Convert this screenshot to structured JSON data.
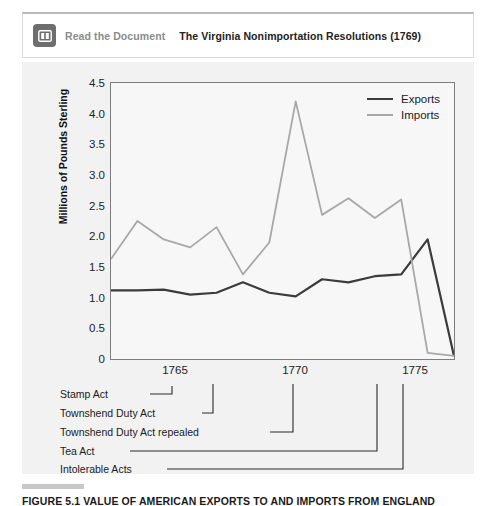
{
  "doc_bar": {
    "icon": "open-book-icon",
    "link_label": "Read the Document",
    "title": "The Virginia Nonimportation Resolutions (1769)"
  },
  "caption": {
    "number": "FIGURE 5.1",
    "text": "VALUE OF AMERICAN EXPORTS TO AND IMPORTS FROM ENGLAND",
    "full": "FIGURE 5.1  VALUE OF AMERICAN EXPORTS TO AND IMPORTS FROM ENGLAND"
  },
  "colors": {
    "exports": "#3b3b3b",
    "imports": "#a8a8a8",
    "panel": "#f2f2f2",
    "plot_bg": "#f7f7f7",
    "frame": "#7d7d7d",
    "icon_bg": "#6e6e6e",
    "muted_text": "#8b8b8b"
  },
  "chart_data": {
    "type": "line",
    "title": "VALUE OF AMERICAN EXPORTS TO AND IMPORTS FROM ENGLAND",
    "xlabel": "",
    "ylabel": "Millions of Pounds Sterling",
    "ylabel_lines": [
      "Millions of",
      "Pounds Sterling"
    ],
    "xlim": [
      1763,
      1776
    ],
    "ylim": [
      0,
      4.5
    ],
    "grid": false,
    "legend_position": "top-right",
    "yticks": [
      "0",
      "0.5",
      "1.0",
      "1.5",
      "2.0",
      "2.5",
      "3.0",
      "3.5",
      "4.0",
      "4.5"
    ],
    "ytick_values": [
      0,
      0.5,
      1.0,
      1.5,
      2.0,
      2.5,
      3.0,
      3.5,
      4.0,
      4.5
    ],
    "xticks": [
      "1765",
      "1770",
      "1775"
    ],
    "xtick_values": [
      1765,
      1770,
      1775
    ],
    "x": [
      1763,
      1764,
      1765,
      1766,
      1767,
      1768,
      1769,
      1770,
      1771,
      1772,
      1773,
      1774,
      1775,
      1776
    ],
    "series": [
      {
        "name": "Exports",
        "color": "#3b3b3b",
        "values": [
          1.12,
          1.12,
          1.13,
          1.05,
          1.08,
          1.25,
          1.08,
          1.02,
          1.3,
          1.25,
          1.35,
          1.38,
          1.95,
          0.05
        ]
      },
      {
        "name": "Imports",
        "color": "#a8a8a8",
        "values": [
          1.63,
          2.25,
          1.95,
          1.82,
          2.15,
          1.38,
          1.9,
          4.2,
          2.35,
          2.62,
          2.3,
          2.6,
          0.1,
          0.05
        ]
      }
    ],
    "annotations": [
      {
        "label": "Stamp Act",
        "year": 1765
      },
      {
        "label": "Townshend Duty Act",
        "year": 1767
      },
      {
        "label": "Townshend Duty Act repealed",
        "year": 1770
      },
      {
        "label": "Tea Act",
        "year": 1773
      },
      {
        "label": "Intolerable Acts",
        "year": 1774
      }
    ]
  }
}
